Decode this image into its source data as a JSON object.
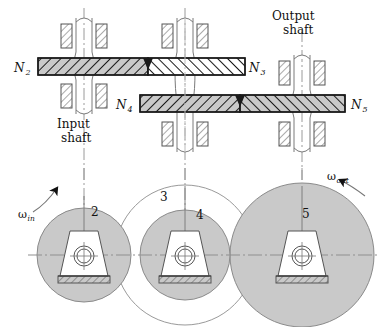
{
  "figure": {
    "type": "mechanical-gear-train-diagram",
    "title_visible": false
  },
  "labels": {
    "input_shaft": "Input\nshaft",
    "input_shaft_line1": "Input",
    "input_shaft_line2": "shaft",
    "output_shaft_line1": "Output",
    "output_shaft_line2": "shaft",
    "omega_in_symbol": "ω",
    "omega_in_sub": "in",
    "omega_out_symbol": "ω",
    "omega_out_sub": "out"
  },
  "gear_labels": [
    {
      "id": "N2",
      "symbol": "N",
      "sub": "2",
      "x": 14,
      "y": 72
    },
    {
      "id": "N3",
      "symbol": "N",
      "sub": "3",
      "x": 245,
      "y": 72
    },
    {
      "id": "N4",
      "symbol": "N",
      "sub": "4",
      "x": 116,
      "y": 108
    },
    {
      "id": "N5",
      "symbol": "N",
      "sub": "5",
      "x": 351,
      "y": 108
    }
  ],
  "gear_numbers": [
    {
      "id": "2",
      "label": "2",
      "x": 91,
      "y": 216
    },
    {
      "id": "3",
      "label": "3",
      "x": 160,
      "y": 201
    },
    {
      "id": "4",
      "label": "4",
      "x": 196,
      "y": 219
    },
    {
      "id": "5",
      "label": "5",
      "x": 302,
      "y": 218
    }
  ],
  "pitch_circles": [
    {
      "id": "gear-2",
      "cx": 84,
      "cy": 255,
      "r": 47,
      "fill": "#c9c9c9",
      "stroke": "#8a8a8a",
      "filled": true
    },
    {
      "id": "gear-3",
      "cx": 185,
      "cy": 255,
      "r": 70,
      "fill": "none",
      "stroke": "#9a9a9a",
      "filled": false
    },
    {
      "id": "gear-4",
      "cx": 185,
      "cy": 255,
      "r": 45,
      "fill": "#c9c9c9",
      "stroke": "#8a8a8a",
      "filled": true
    },
    {
      "id": "gear-5",
      "cx": 302,
      "cy": 255,
      "r": 72,
      "fill": "#c9c9c9",
      "stroke": "#8a8a8a",
      "filled": true
    }
  ],
  "shafts": [
    {
      "id": "input-shaft",
      "x": 84,
      "role": "input"
    },
    {
      "id": "middle-shaft",
      "x": 185,
      "role": "intermediate"
    },
    {
      "id": "output-shaft",
      "x": 302,
      "role": "output"
    }
  ],
  "gear_bars": [
    {
      "id": "N2",
      "x": 38,
      "y": 58,
      "w": 110,
      "h": 17,
      "fill": "#c9c9c9",
      "hatch": "back"
    },
    {
      "id": "N3",
      "x": 148,
      "y": 58,
      "w": 97,
      "h": 17,
      "fill": "#ffffff",
      "hatch": "fwd"
    },
    {
      "id": "N4",
      "x": 140,
      "y": 95,
      "w": 100,
      "h": 17,
      "fill": "#c9c9c9",
      "hatch": "back"
    },
    {
      "id": "N5",
      "x": 240,
      "y": 95,
      "w": 105,
      "h": 17,
      "fill": "#c9c9c9",
      "hatch": "fwd"
    }
  ],
  "colors": {
    "gear_fill": "#c9c9c9",
    "gear_stroke": "#8a8a8a",
    "line": "#1a1a1a",
    "centerline": "#9a9a9a",
    "background": "#ffffff"
  }
}
